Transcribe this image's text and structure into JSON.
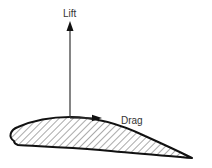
{
  "diagram": {
    "labels": {
      "lift": "Lift",
      "drag": "Drag"
    },
    "colors": {
      "stroke": "#111111",
      "hatch": "#555555",
      "text": "#333333",
      "background": "#ffffff"
    },
    "elements": [
      {
        "id": "airfoil",
        "type": "shape",
        "description": "hatched airfoil cross-section, rounded leading edge at left, sharp trailing edge at lower right"
      },
      {
        "id": "lift-arrow",
        "type": "arrow",
        "direction": "up",
        "label": "Lift"
      },
      {
        "id": "drag-arrow",
        "type": "arrow",
        "direction": "right",
        "label": "Drag"
      }
    ]
  }
}
